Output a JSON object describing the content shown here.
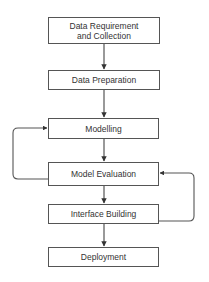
{
  "diagram": {
    "type": "flowchart",
    "colors": {
      "stroke": "#555555",
      "text": "#333333",
      "background": "#ffffff"
    },
    "nodes": [
      {
        "id": "n1",
        "label": "Data Requirement\nand Collection"
      },
      {
        "id": "n2",
        "label": "Data Preparation"
      },
      {
        "id": "n3",
        "label": "Modelling"
      },
      {
        "id": "n4",
        "label": "Model Evaluation"
      },
      {
        "id": "n5",
        "label": "Interface Building"
      },
      {
        "id": "n6",
        "label": "Deployment"
      }
    ],
    "edges": [
      {
        "from": "n1",
        "to": "n2"
      },
      {
        "from": "n2",
        "to": "n3"
      },
      {
        "from": "n3",
        "to": "n4"
      },
      {
        "from": "n4",
        "to": "n5"
      },
      {
        "from": "n5",
        "to": "n6"
      },
      {
        "from": "n4",
        "to": "n3",
        "style": "feedback-loop-left"
      },
      {
        "from": "n5",
        "to": "n4",
        "style": "feedback-loop-right"
      }
    ]
  }
}
